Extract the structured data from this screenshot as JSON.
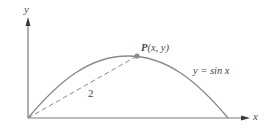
{
  "diagram": {
    "type": "function-graph",
    "axes": {
      "x_label": "x",
      "y_label": "y"
    },
    "curve": {
      "equation_label": "y = sin x",
      "function": "sin x",
      "domain": [
        0,
        3.14159
      ]
    },
    "point": {
      "name": "P",
      "coords_label": "(x, y)",
      "full_label": "P(x, y)"
    },
    "segment": {
      "from": "origin",
      "to": "P",
      "style": "dashed",
      "length_label": "2"
    },
    "colors": {
      "axis": "#7a7a7a",
      "curve": "#8a8a8a",
      "point": "#8a8a8a",
      "text": "#4a4a4a"
    }
  }
}
